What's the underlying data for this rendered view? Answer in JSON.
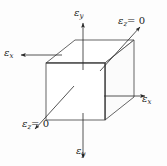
{
  "figure": {
    "background_color": "#fdfdfd",
    "line_color": "#3c3c3c",
    "text_color": "#1a1a1a"
  },
  "labels": {
    "epsilon_y_top": {
      "symbol": "ε",
      "subscript": "y",
      "equals": ""
    },
    "epsilon_z_top": {
      "symbol": "ε",
      "subscript": "z",
      "equals": "= 0"
    },
    "epsilon_x_left": {
      "symbol": "ε",
      "subscript": "x",
      "equals": ""
    },
    "epsilon_x_right": {
      "symbol": "ε",
      "subscript": "x",
      "equals": ""
    },
    "epsilon_z_bottom": {
      "symbol": "ε",
      "subscript": "z",
      "equals": "= 0"
    },
    "epsilon_y_bottom": {
      "symbol": "ε",
      "subscript": "y",
      "equals": ""
    }
  },
  "cube": {
    "front_face": "46,63 105,63 105,120 46,120",
    "top_face": "46,63 75,40 134,40 105,63",
    "right_face": "105,63 134,40 134,97 105,120",
    "vertices": {
      "front_top_left": [
        46,
        63
      ],
      "front_top_right": [
        105,
        63
      ],
      "front_bottom_left": [
        46,
        120
      ],
      "front_bottom_right": [
        105,
        120
      ],
      "back_top_left": [
        75,
        40
      ],
      "back_top_right": [
        134,
        40
      ],
      "back_bottom_right": [
        134,
        97
      ]
    }
  },
  "arrows": {
    "eps_y_top": {
      "from": [
        83,
        68
      ],
      "to": [
        83,
        22
      ],
      "direction": "up"
    },
    "eps_y_bottom": {
      "from": [
        83,
        115
      ],
      "to": [
        83,
        160
      ],
      "direction": "down"
    },
    "eps_x_left": {
      "from": [
        60,
        56
      ],
      "to": [
        20,
        56
      ],
      "direction": "left"
    },
    "eps_x_right": {
      "from": [
        105,
        97
      ],
      "to": [
        146,
        97
      ],
      "direction": "right"
    },
    "eps_z_top": {
      "from": [
        100,
        71
      ],
      "to": [
        141,
        26
      ],
      "direction": "up-right"
    },
    "eps_z_bottom": {
      "from": [
        74,
        86
      ],
      "to": [
        33,
        131
      ],
      "direction": "down-left"
    }
  }
}
